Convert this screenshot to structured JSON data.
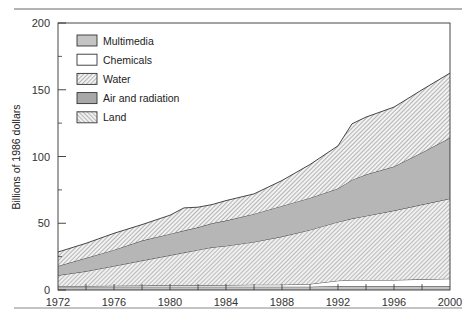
{
  "chart_data": {
    "type": "area",
    "stacked": true,
    "title": "",
    "xlabel": "",
    "ylabel": "Billions of 1986 dollars",
    "ylim": [
      0,
      200
    ],
    "xlim": [
      1972,
      2000
    ],
    "y_ticks": [
      0,
      50,
      100,
      150,
      200
    ],
    "y_minor_ticks": [
      25,
      75,
      125,
      175
    ],
    "x_ticks": [
      1972,
      1976,
      1980,
      1984,
      1988,
      1992,
      1996,
      2000
    ],
    "grid": false,
    "legend_position": "upper-left",
    "legend": [
      {
        "name": "Multimedia",
        "fill": "#c4c4c4",
        "pattern": "solid"
      },
      {
        "name": "Chemicals",
        "fill": "#ffffff",
        "pattern": "solid"
      },
      {
        "name": "Water",
        "fill": "#d6d6d6",
        "pattern": "hatch"
      },
      {
        "name": "Air and radiation",
        "fill": "#b4b4b4",
        "pattern": "solid"
      },
      {
        "name": "Land",
        "fill": "#dcdcdc",
        "pattern": "hatch"
      }
    ],
    "x": [
      1972,
      1974,
      1976,
      1978,
      1980,
      1981,
      1982,
      1983,
      1984,
      1986,
      1988,
      1990,
      1992,
      1993,
      1994,
      1996,
      1998,
      2000
    ],
    "stack_order_bottom_to_top": [
      "Multimedia",
      "Chemicals",
      "Land",
      "Air and radiation",
      "Water"
    ],
    "series": [
      {
        "name": "Multimedia",
        "values": [
          2.5,
          2.5,
          2.5,
          2.5,
          2.5,
          2.5,
          2.5,
          2.5,
          2.5,
          2.5,
          2.5,
          2.5,
          3,
          3,
          3,
          3,
          3,
          3
        ]
      },
      {
        "name": "Chemicals",
        "values": [
          0.5,
          0.5,
          0.7,
          0.8,
          1,
          1,
          1,
          1,
          1.2,
          1.5,
          1.5,
          2,
          4,
          4.5,
          4.5,
          4.5,
          5,
          5.5
        ]
      },
      {
        "name": "Land",
        "values": [
          8,
          11,
          14.8,
          18.7,
          22.5,
          24.5,
          26.5,
          28.5,
          29.3,
          32,
          36,
          40.5,
          44,
          46,
          48,
          52,
          56,
          60
        ]
      },
      {
        "name": "Air and radiation",
        "values": [
          7,
          10,
          12,
          15,
          16,
          16.5,
          17,
          18,
          19,
          21,
          23,
          24,
          25,
          29,
          31,
          33,
          39,
          45.5
        ]
      },
      {
        "name": "Water",
        "values": [
          10.5,
          11,
          12.5,
          12,
          14,
          17,
          15,
          14,
          15,
          15,
          19,
          25,
          32,
          42,
          43,
          44.5,
          47,
          48.5
        ]
      }
    ],
    "cumulative_tops": {
      "Multimedia": [
        2.5,
        2.5,
        2.5,
        2.5,
        2.5,
        2.5,
        2.5,
        2.5,
        2.5,
        2.5,
        2.5,
        2.5,
        3,
        3,
        3,
        3,
        3,
        3
      ],
      "Chemicals": [
        3,
        3,
        3.2,
        3.3,
        3.5,
        3.5,
        3.5,
        3.5,
        3.7,
        4,
        4,
        4.5,
        7,
        7.5,
        7.5,
        7.5,
        8,
        8.5
      ],
      "Land": [
        11,
        14,
        18,
        22,
        26,
        28,
        30,
        32,
        33,
        36,
        40,
        45,
        51,
        53.5,
        55.5,
        59.5,
        64,
        68.5
      ],
      "Air and radiation": [
        18,
        24,
        30,
        37,
        42,
        44.5,
        47,
        50,
        52,
        57,
        63,
        69,
        76,
        82.5,
        86.5,
        92.5,
        103,
        114
      ],
      "Water": [
        28.5,
        35,
        42.5,
        49,
        56,
        61.5,
        62,
        64,
        67,
        72,
        82,
        94,
        108,
        124.5,
        129.5,
        137,
        150,
        162.5
      ]
    }
  }
}
